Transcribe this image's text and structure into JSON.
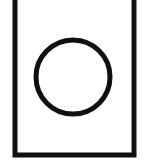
{
  "figure": {
    "title": "Circle inside rectangle outline",
    "background_color": "#ffffff",
    "canvas": {
      "width": 148,
      "height": 162
    },
    "shapes": [
      {
        "name": "outer-rectangle",
        "type": "rectangle",
        "stroke_color": "#101010",
        "fill_color": "#ffffff",
        "stroke_width": 5,
        "x": 15,
        "y": -8,
        "width": 119,
        "height": 163,
        "note": "top edge cropped above canvas"
      },
      {
        "name": "inner-circle",
        "type": "circle",
        "stroke_color": "#101010",
        "fill_color": "#ffffff",
        "stroke_width": 5,
        "center_x": 73,
        "center_y": 77,
        "radius": 37
      }
    ]
  },
  "labels": {
    "figure_alt": "Circle inside rectangle outline",
    "rectangle_label": "rectangle",
    "circle_label": "circle"
  }
}
